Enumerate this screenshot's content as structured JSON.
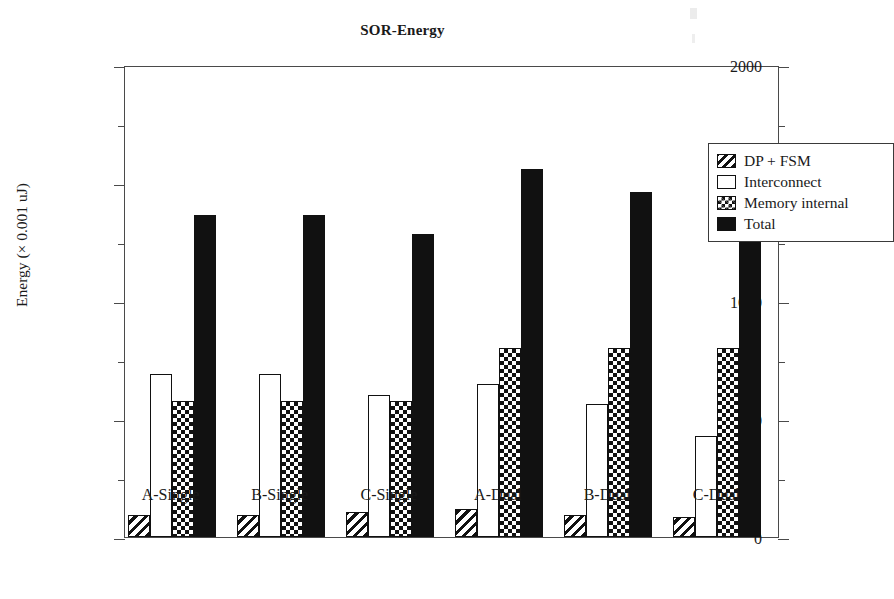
{
  "chart_data": {
    "type": "bar",
    "title": "SOR-Energy",
    "xlabel": "",
    "ylabel": "Energy (× 0.001 uJ)",
    "categories": [
      "A-Single",
      "B-Single",
      "C-Single",
      "A-Dual",
      "B-Dual",
      "C-Dual"
    ],
    "series": [
      {
        "name": "DP + FSM",
        "values": [
          95,
          95,
          105,
          120,
          95,
          85
        ]
      },
      {
        "name": "Interconnect",
        "values": [
          690,
          690,
          600,
          650,
          565,
          430
        ]
      },
      {
        "name": "Memory internal",
        "values": [
          575,
          575,
          575,
          800,
          800,
          800
        ]
      },
      {
        "name": "Total",
        "values": [
          1365,
          1365,
          1285,
          1560,
          1460,
          1305
        ]
      }
    ],
    "ylim": [
      0,
      2000
    ],
    "y_ticks_major": [
      0,
      500,
      1000,
      1500,
      2000
    ],
    "y_tick_labels": [
      "0",
      "500",
      "1000",
      "1500",
      "2000"
    ],
    "y_ticks_minor": [
      250,
      750,
      1250,
      1750
    ],
    "grid": false,
    "legend_position": "upper right",
    "legend_entries": [
      "DP + FSM",
      "Interconnect",
      "Memory internal",
      "Total"
    ],
    "swatch_styles": [
      "diagonal-hatch",
      "empty-white",
      "checkerboard",
      "solid-black"
    ],
    "colors": {
      "ink": "#111111",
      "axis": "#4a4a4a",
      "background": "#ffffff"
    }
  }
}
